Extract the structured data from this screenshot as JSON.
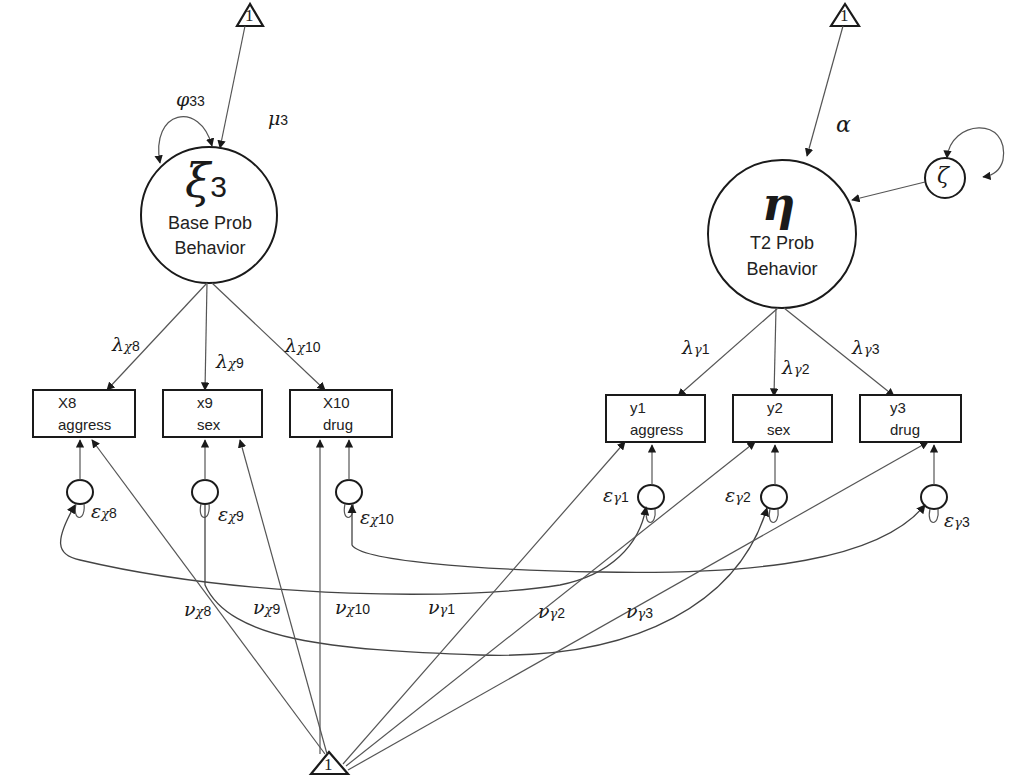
{
  "latents": {
    "xi3": {
      "symbol": "ξ",
      "sub": "3",
      "line1": "Base Prob",
      "line2": "Behavior"
    },
    "eta": {
      "symbol": "η",
      "line1": "T2 Prob",
      "line2": "Behavior"
    },
    "zeta": {
      "symbol": "ζ"
    }
  },
  "constants": {
    "one": "1"
  },
  "params": {
    "phi": {
      "symbol": "φ",
      "sub": "33"
    },
    "mu": {
      "symbol": "μ",
      "sub": "3"
    },
    "alpha": {
      "symbol": "α"
    },
    "lambda": {
      "symbol": "λ"
    },
    "epsilon": {
      "symbol": "ε"
    },
    "nu": {
      "symbol": "ν"
    },
    "chi": "χ",
    "gamma": "γ"
  },
  "indicators": {
    "x8": {
      "code": "X8",
      "name": "aggress",
      "sub": "8"
    },
    "x9": {
      "code": "x9",
      "name": "sex",
      "sub": "9"
    },
    "x10": {
      "code": "X10",
      "name": "drug",
      "sub": "10"
    },
    "y1": {
      "code": "y1",
      "name": "aggress",
      "sub": "1"
    },
    "y2": {
      "code": "y2",
      "name": "sex",
      "sub": "2"
    },
    "y3": {
      "code": "y3",
      "name": "drug",
      "sub": "3"
    }
  },
  "colors": {
    "stroke": "#2a2a2a",
    "line": "#555555",
    "background": "#ffffff"
  }
}
